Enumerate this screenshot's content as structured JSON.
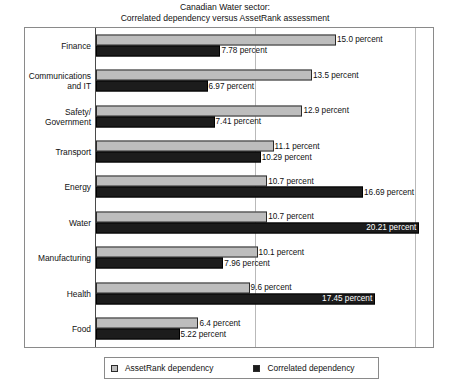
{
  "chart_data": {
    "type": "bar",
    "orientation": "horizontal",
    "title": "Canadian Water sector:",
    "subtitle": "Correlated dependency versus AssetRank assessment",
    "xlabel": "",
    "ylabel": "",
    "xlim": [
      0,
      21.3
    ],
    "grid": true,
    "gridlines": [
      10,
      20
    ],
    "legend_position": "bottom",
    "categories": [
      "Finance",
      "Communications\nand IT",
      "Safety/\nGovernment",
      "Transport",
      "Energy",
      "Water",
      "Manufacturing",
      "Health",
      "Food"
    ],
    "series": [
      {
        "name": "AssetRank dependency",
        "color": "#bdbdbd",
        "values": [
          15.0,
          13.5,
          12.9,
          11.1,
          10.7,
          10.7,
          10.1,
          9.6,
          6.4
        ],
        "labels": [
          "15.0 percent",
          "13.5 percent",
          "12.9 percent",
          "11.1 percent",
          "10.7 percent",
          "10.7 percent",
          "10.1 percent",
          "9.6 percent",
          "6.4 percent"
        ]
      },
      {
        "name": "Correlated dependency",
        "color": "#1c1c1c",
        "values": [
          7.78,
          6.97,
          7.41,
          10.29,
          16.69,
          20.21,
          7.96,
          17.45,
          5.22
        ],
        "labels": [
          "7.78 percent",
          "6.97 percent",
          "7.41 percent",
          "10.29 percent",
          "16.69 percent",
          "20.21 percent",
          "7.96 percent",
          "17.45 percent",
          "5.22 percent"
        ]
      }
    ]
  },
  "legend": {
    "entries": [
      {
        "label": "AssetRank dependency"
      },
      {
        "label": "Correlated dependency"
      }
    ]
  }
}
